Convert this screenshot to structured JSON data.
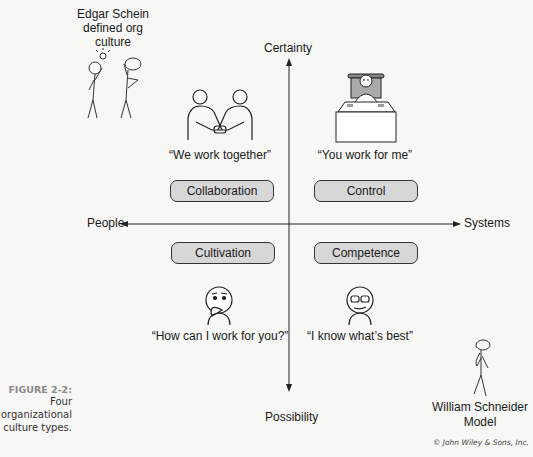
{
  "axes": {
    "top": "Certainty",
    "bottom": "Possibility",
    "left": "People",
    "right": "Systems"
  },
  "quadrants": [
    {
      "name": "Collaboration",
      "quote": "“We work together”",
      "icon": "handshake-icon",
      "position": "top-left"
    },
    {
      "name": "Control",
      "quote": "“You work for me”",
      "icon": "boss-at-desk-icon",
      "position": "top-right"
    },
    {
      "name": "Cultivation",
      "quote": "“How can I work for you?”",
      "icon": "thinking-person-icon",
      "position": "bottom-left"
    },
    {
      "name": "Competence",
      "quote": "“I know what’s best”",
      "icon": "glasses-person-icon",
      "position": "bottom-right"
    }
  ],
  "annotations": {
    "top_left": "Edgar Schein defined org culture",
    "top_left_lines": [
      "Edgar Schein",
      "defined org",
      "culture"
    ],
    "bottom_right_lines": [
      "William Schneider",
      "Model"
    ]
  },
  "caption": {
    "figure_label": "FIGURE 2-2:",
    "lines": [
      "Four",
      "organizational",
      "culture types."
    ]
  },
  "credit": "© John Wiley & Sons, Inc."
}
